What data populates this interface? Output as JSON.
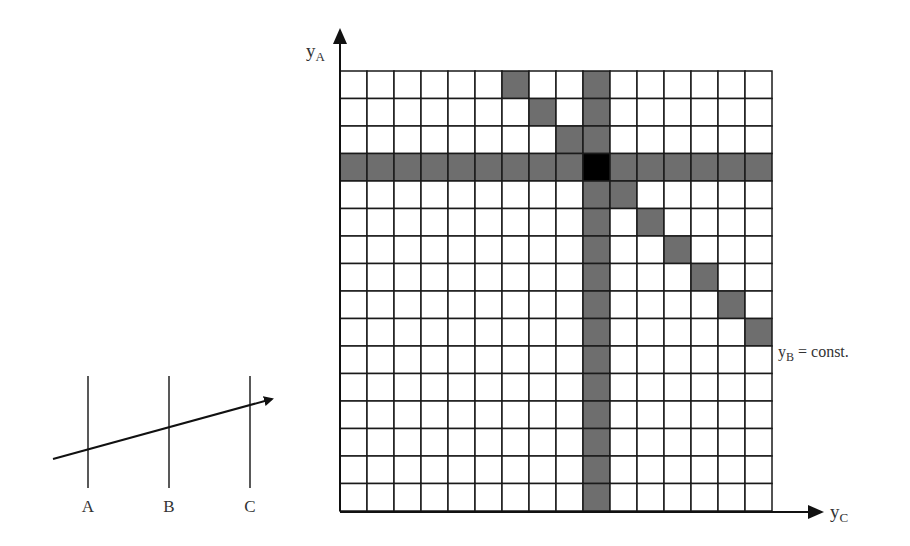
{
  "figure": {
    "grid": {
      "rows": 16,
      "cols": 16,
      "origin_x": 340,
      "origin_y": 71,
      "cell_w": 27,
      "cell_h": 27.5,
      "line_color": "#1a1a1a",
      "shade_color": "#6e6e6e",
      "highlight_color": "#000000",
      "shaded_row": 3,
      "shaded_col": 9,
      "highlight_cell": {
        "row": 3,
        "col": 9
      },
      "diagonal_cells": [
        {
          "row": 0,
          "col": 6
        },
        {
          "row": 1,
          "col": 7
        },
        {
          "row": 2,
          "col": 8
        },
        {
          "row": 4,
          "col": 10
        },
        {
          "row": 5,
          "col": 11
        },
        {
          "row": 6,
          "col": 12
        },
        {
          "row": 7,
          "col": 13
        },
        {
          "row": 8,
          "col": 14
        },
        {
          "row": 9,
          "col": 15
        }
      ]
    },
    "axes": {
      "y_label": "y",
      "y_label_sub": "A",
      "x_label": "y",
      "x_label_sub": "C",
      "diag_label": "y",
      "diag_label_sub": "B",
      "diag_label_suffix": " = const."
    },
    "detectors": {
      "labels": [
        "A",
        "B",
        "C"
      ],
      "x_positions": [
        88,
        169,
        250
      ],
      "top": 376,
      "bottom": 488,
      "track": {
        "x1": 53,
        "y1": 459,
        "x2": 276,
        "y2": 398
      }
    }
  }
}
